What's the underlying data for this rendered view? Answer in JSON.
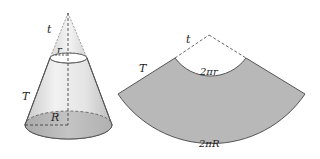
{
  "diagram": {
    "cone": {
      "labels": {
        "small_slant": "t",
        "small_radius": "r",
        "frustum_slant": "T",
        "base_radius": "R"
      }
    },
    "net": {
      "labels": {
        "small_slant": "t",
        "frustum_slant": "T",
        "inner_arc": "2πr",
        "outer_arc": "2πR"
      }
    },
    "colors": {
      "fill_gray": "#b8b8b8",
      "cone_light": "#e6e6e6",
      "stroke": "#555555"
    }
  }
}
